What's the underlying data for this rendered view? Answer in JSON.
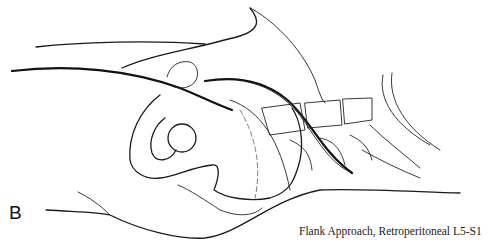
{
  "figure": {
    "panel_label": "B",
    "caption": "Flank Approach, Retroperitoneal L5-S1",
    "colors": {
      "line": "#111111",
      "background": "#ffffff"
    }
  }
}
